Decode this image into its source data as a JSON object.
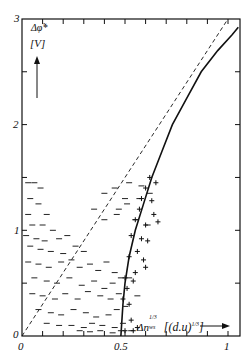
{
  "chart_data": {
    "type": "scatter",
    "title": "",
    "xlabel": "Δn_ws^{1/3} [(d.u)^{1/3}]",
    "ylabel": "Δφ* [V]",
    "xlim": [
      0,
      1.05
    ],
    "ylim": [
      0,
      3
    ],
    "x_ticks": [
      0,
      0.1,
      0.2,
      0.3,
      0.4,
      0.5,
      0.6,
      0.7,
      0.8,
      0.9,
      1.0
    ],
    "x_tick_labels": [
      "0",
      "0.5",
      "1"
    ],
    "y_ticks": [
      0,
      0.5,
      1,
      1.5,
      2,
      2.5,
      3
    ],
    "y_tick_labels": [
      "0",
      "1",
      "2",
      "3"
    ],
    "grid": false,
    "series": [
      {
        "name": "dash markers",
        "marker": "-",
        "x": [
          0.03,
          0.06,
          0.09,
          0.04,
          0.08,
          0.03,
          0.12,
          0.05,
          0.1,
          0.15,
          0.02,
          0.07,
          0.11,
          0.18,
          0.22,
          0.04,
          0.09,
          0.14,
          0.2,
          0.26,
          0.3,
          0.03,
          0.08,
          0.13,
          0.19,
          0.24,
          0.28,
          0.33,
          0.37,
          0.41,
          0.45,
          0.06,
          0.12,
          0.17,
          0.23,
          0.29,
          0.35,
          0.4,
          0.44,
          0.48,
          0.52,
          0.05,
          0.1,
          0.16,
          0.21,
          0.27,
          0.32,
          0.38,
          0.43,
          0.47,
          0.56,
          0.08,
          0.14,
          0.19,
          0.25,
          0.31,
          0.36,
          0.42,
          0.46,
          0.5,
          0.12,
          0.18,
          0.24,
          0.3,
          0.34,
          0.39,
          0.45,
          0.49,
          0.28,
          0.33,
          0.38,
          0.44,
          0.48,
          0.53,
          0.35,
          0.4,
          0.46,
          0.51,
          0.57,
          0.4,
          0.45,
          0.52,
          0.58,
          0.47,
          0.55,
          0.61,
          0.5,
          0.62
        ],
        "y": [
          1.45,
          1.45,
          1.4,
          1.3,
          1.25,
          1.15,
          1.15,
          1.05,
          1.05,
          1.0,
          0.95,
          0.92,
          0.9,
          0.92,
          0.95,
          0.85,
          0.82,
          0.8,
          0.78,
          0.85,
          0.8,
          0.7,
          0.68,
          0.65,
          0.7,
          0.72,
          0.65,
          0.68,
          0.62,
          0.7,
          0.6,
          0.55,
          0.52,
          0.5,
          0.55,
          0.48,
          0.52,
          0.45,
          0.5,
          0.55,
          0.55,
          0.4,
          0.38,
          0.35,
          0.4,
          0.35,
          0.42,
          0.38,
          0.35,
          0.4,
          0.38,
          0.25,
          0.22,
          0.2,
          0.25,
          0.22,
          0.18,
          0.2,
          0.25,
          0.28,
          0.12,
          0.1,
          0.1,
          0.08,
          0.12,
          0.1,
          0.08,
          0.12,
          0.05,
          0.04,
          0.05,
          0.03,
          0.05,
          0.05,
          1.2,
          1.1,
          1.15,
          1.25,
          1.3,
          1.35,
          1.4,
          1.45,
          1.42,
          1.2,
          1.1,
          1.05,
          1.3,
          1.35
        ]
      },
      {
        "name": "plus markers",
        "marker": "+",
        "x": [
          0.62,
          0.65,
          0.6,
          0.58,
          0.63,
          0.57,
          0.64,
          0.55,
          0.6,
          0.66,
          0.53,
          0.58,
          0.61,
          0.56,
          0.52,
          0.59,
          0.55,
          0.5,
          0.54,
          0.51,
          0.49,
          0.52,
          0.53,
          0.5,
          0.54,
          0.56,
          0.6
        ],
        "y": [
          1.5,
          1.45,
          1.4,
          1.3,
          1.28,
          1.2,
          1.15,
          1.1,
          1.05,
          1.08,
          0.95,
          0.92,
          0.9,
          0.8,
          0.75,
          0.72,
          0.6,
          0.55,
          0.52,
          0.45,
          0.35,
          0.3,
          0.15,
          0.05,
          0.05,
          0.08,
          0.65
        ]
      }
    ],
    "lines": [
      {
        "name": "theory curve (solid)",
        "style": "solid",
        "x": [
          0.48,
          0.485,
          0.49,
          0.5,
          0.52,
          0.55,
          0.59,
          0.63,
          0.68,
          0.73,
          0.8,
          0.87,
          0.95,
          1.02,
          1.05
        ],
        "y": [
          0.0,
          0.15,
          0.3,
          0.5,
          0.75,
          1.0,
          1.25,
          1.5,
          1.75,
          2.0,
          2.25,
          2.5,
          2.7,
          2.85,
          2.92
        ]
      },
      {
        "name": "reference line (dashed)",
        "style": "dashed",
        "x": [
          0.0,
          1.0
        ],
        "y": [
          0.0,
          3.0
        ]
      }
    ],
    "annotations": [
      {
        "text": "Δφ*",
        "position": "top-left"
      },
      {
        "text": "[V]",
        "position": "top-left"
      },
      {
        "text": "Δn_ws^{1/3} [(d.u)^{1/3}]",
        "position": "bottom-right"
      }
    ]
  },
  "labels": {
    "y_axis_symbol": "Δφ̃*",
    "y_axis_unit": "[V]",
    "x_axis_symbol": "Δn",
    "x_axis_sub": "ws",
    "x_axis_sup": "1/3",
    "x_axis_unit": "[(d.u)",
    "x_axis_unit_sup": "1/3",
    "x_axis_unit_close": "]",
    "x_tick_0": "0",
    "x_tick_05": "0.5",
    "x_tick_1": "1",
    "y_tick_0": "0",
    "y_tick_1": "1",
    "y_tick_2": "2",
    "y_tick_3": "3"
  }
}
